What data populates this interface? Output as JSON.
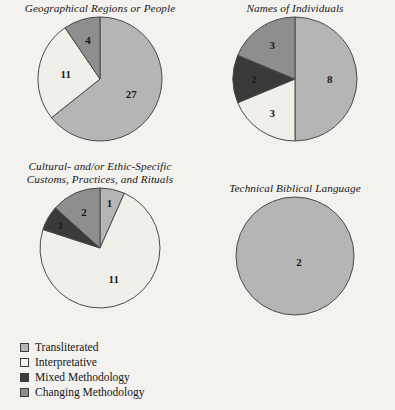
{
  "figure": {
    "background_color": "#f3f2ee",
    "palette": {
      "transliterated": "#b5b5b5",
      "interpretative": "#f0efea",
      "mixed_methodology": "#3a3a3a",
      "changing_methodology": "#8e8e8e",
      "outline": "#4a4a4a"
    }
  },
  "legend": {
    "name": "methodology-legend",
    "items": [
      {
        "label": "Transliterated",
        "color": "#b5b5b5"
      },
      {
        "label": "Interpretative",
        "color": "#f5f4f0"
      },
      {
        "label": "Mixed Methodology",
        "color": "#3a3a3a"
      },
      {
        "label": "Changing Methodology",
        "color": "#8e8e8e"
      }
    ]
  },
  "chart_data": [
    {
      "type": "pie",
      "title": "Geographical Regions or People",
      "id": "geographical-regions-or-people",
      "total": 42,
      "start_angle": 0,
      "direction": "clockwise",
      "categories": [
        "Transliterated",
        "Interpretative",
        "Changing Methodology"
      ],
      "values": [
        27,
        11,
        4
      ],
      "labels": [
        "27",
        "11",
        "4"
      ],
      "colors": [
        "#b5b5b5",
        "#f0efea",
        "#8e8e8e"
      ]
    },
    {
      "type": "pie",
      "title": "Names of Individuals",
      "id": "names-of-individuals",
      "total": 16,
      "start_angle": 0,
      "direction": "clockwise",
      "categories": [
        "Transliterated",
        "Interpretative",
        "Mixed Methodology",
        "Changing Methodology"
      ],
      "values": [
        8,
        3,
        2,
        3
      ],
      "labels": [
        "8",
        "3",
        "2",
        "3"
      ],
      "colors": [
        "#b5b5b5",
        "#f0efea",
        "#3a3a3a",
        "#8e8e8e"
      ]
    },
    {
      "type": "pie",
      "title": "Cultural- and/or Ethic-Specific\nCustoms, Practices, and Rituals",
      "id": "cultural-ethic-specific-customs-practices-rituals",
      "total": 15,
      "start_angle": 0,
      "direction": "clockwise",
      "categories": [
        "Transliterated",
        "Interpretative",
        "Mixed Methodology",
        "Changing Methodology"
      ],
      "values": [
        1,
        11,
        1,
        2
      ],
      "labels": [
        "1",
        "11",
        "1",
        "2"
      ],
      "colors": [
        "#b5b5b5",
        "#f0efea",
        "#3a3a3a",
        "#8e8e8e"
      ]
    },
    {
      "type": "pie",
      "title": "Technical Biblical Language",
      "id": "technical-biblical-language",
      "total": 2,
      "start_angle": 0,
      "direction": "clockwise",
      "categories": [
        "Transliterated"
      ],
      "values": [
        2
      ],
      "labels": [
        "2"
      ],
      "colors": [
        "#b5b5b5"
      ]
    }
  ]
}
